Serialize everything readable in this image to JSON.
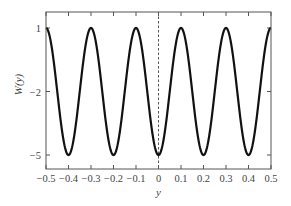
{
  "chart_data": {
    "type": "line",
    "title": "",
    "xlabel": "y",
    "ylabel": "W(y)",
    "xlim": [
      -0.5,
      0.5
    ],
    "ylim": [
      -5.5,
      1.5
    ],
    "x_ticks": [
      -0.5,
      -0.4,
      -0.3,
      -0.2,
      -0.1,
      0,
      0.1,
      0.2,
      0.3,
      0.4,
      0.5
    ],
    "x_tick_labels": [
      "−0.5",
      "−0.4",
      "−0.3",
      "−0.2",
      "−0.1",
      "0",
      "0.1",
      "0.2",
      "0.3",
      "0.4",
      "0.5"
    ],
    "y_ticks": [
      1,
      -2,
      -5
    ],
    "y_tick_labels": [
      "1",
      "−2",
      "−5"
    ],
    "grid": false,
    "legend": null,
    "annotations": [
      "dashed vertical line at y = 0"
    ],
    "series": [
      {
        "name": "W(y)",
        "formula": "-2 - 3*cos(10*pi*y)",
        "x": [
          -0.5,
          -0.45,
          -0.4,
          -0.35,
          -0.3,
          -0.25,
          -0.2,
          -0.15,
          -0.1,
          -0.05,
          0,
          0.05,
          0.1,
          0.15,
          0.2,
          0.25,
          0.3,
          0.35,
          0.4,
          0.45,
          0.5
        ],
        "values": [
          1,
          -2,
          -5,
          -2,
          1,
          -2,
          -5,
          -2,
          1,
          -2,
          -5,
          -2,
          1,
          -2,
          -5,
          -2,
          1,
          -2,
          -5,
          -2,
          1
        ],
        "color": "#111111"
      }
    ],
    "colors": {
      "curve": "#111111",
      "axes": "#555555",
      "dashed_line": "#555555"
    }
  }
}
